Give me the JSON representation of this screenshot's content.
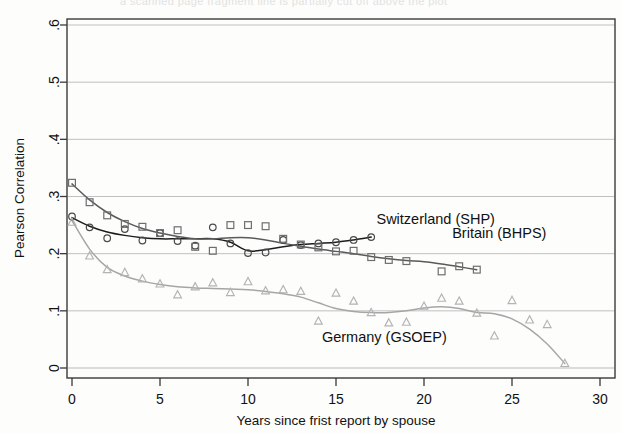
{
  "figure": {
    "top_edge_artifact": "a scanned page fragment line is partially cut off above the plot",
    "background_color": "#fdfdfc"
  },
  "chart_data": {
    "type": "scatter",
    "title": "",
    "subtitle": "",
    "xlabel": "Years since frist report by spouse",
    "ylabel": "Pearson Correlation",
    "xlim": [
      0,
      30
    ],
    "ylim": [
      0,
      0.6
    ],
    "xticks": [
      0,
      5,
      10,
      15,
      20,
      25,
      30
    ],
    "xticklabels": [
      "0",
      "5",
      "10",
      "15",
      "20",
      "25",
      "30"
    ],
    "yticks": [
      0,
      0.1,
      0.2,
      0.3,
      0.4,
      0.5,
      0.6
    ],
    "yticklabels": [
      "0",
      ".1",
      ".2",
      ".3",
      ".4",
      ".5",
      ".6"
    ],
    "grid": "horizontal gridlines only",
    "legend_position": "inline annotations next to each curve",
    "series": [
      {
        "name": "Switzerland (SHP)",
        "marker": "circle",
        "color": "#4a4a4a",
        "fit_color": "#1c1c1c",
        "label_x": 17.3,
        "label_y": 0.252,
        "points": [
          {
            "x": 0,
            "y": 0.265
          },
          {
            "x": 1,
            "y": 0.246
          },
          {
            "x": 2,
            "y": 0.227
          },
          {
            "x": 3,
            "y": 0.243
          },
          {
            "x": 4,
            "y": 0.223
          },
          {
            "x": 5,
            "y": 0.236
          },
          {
            "x": 6,
            "y": 0.222
          },
          {
            "x": 7,
            "y": 0.214
          },
          {
            "x": 8,
            "y": 0.246
          },
          {
            "x": 9,
            "y": 0.218
          },
          {
            "x": 10,
            "y": 0.201
          },
          {
            "x": 11,
            "y": 0.202
          },
          {
            "x": 12,
            "y": 0.224
          },
          {
            "x": 13,
            "y": 0.215
          },
          {
            "x": 14,
            "y": 0.218
          },
          {
            "x": 15,
            "y": 0.22
          },
          {
            "x": 16,
            "y": 0.224
          },
          {
            "x": 17,
            "y": 0.229
          }
        ],
        "fit": [
          {
            "x": 0,
            "y": 0.263
          },
          {
            "x": 1,
            "y": 0.248
          },
          {
            "x": 2,
            "y": 0.238
          },
          {
            "x": 3,
            "y": 0.232
          },
          {
            "x": 4,
            "y": 0.228
          },
          {
            "x": 5,
            "y": 0.226
          },
          {
            "x": 6,
            "y": 0.226
          },
          {
            "x": 7,
            "y": 0.226
          },
          {
            "x": 8,
            "y": 0.226
          },
          {
            "x": 9,
            "y": 0.22
          },
          {
            "x": 10,
            "y": 0.205
          },
          {
            "x": 11,
            "y": 0.207
          },
          {
            "x": 12,
            "y": 0.212
          },
          {
            "x": 13,
            "y": 0.216
          },
          {
            "x": 14,
            "y": 0.218
          },
          {
            "x": 15,
            "y": 0.22
          },
          {
            "x": 16,
            "y": 0.224
          },
          {
            "x": 17,
            "y": 0.229
          }
        ]
      },
      {
        "name": "Britain (BHPS)",
        "marker": "square",
        "color": "#6e6e6e",
        "fit_color": "#5a5a5a",
        "label_x": 21.6,
        "label_y": 0.228,
        "points": [
          {
            "x": 0,
            "y": 0.324
          },
          {
            "x": 1,
            "y": 0.29
          },
          {
            "x": 2,
            "y": 0.267
          },
          {
            "x": 3,
            "y": 0.252
          },
          {
            "x": 4,
            "y": 0.247
          },
          {
            "x": 5,
            "y": 0.236
          },
          {
            "x": 6,
            "y": 0.241
          },
          {
            "x": 7,
            "y": 0.212
          },
          {
            "x": 8,
            "y": 0.205
          },
          {
            "x": 9,
            "y": 0.25
          },
          {
            "x": 10,
            "y": 0.25
          },
          {
            "x": 11,
            "y": 0.248
          },
          {
            "x": 12,
            "y": 0.226
          },
          {
            "x": 13,
            "y": 0.216
          },
          {
            "x": 14,
            "y": 0.211
          },
          {
            "x": 15,
            "y": 0.204
          },
          {
            "x": 16,
            "y": 0.205
          },
          {
            "x": 17,
            "y": 0.194
          },
          {
            "x": 18,
            "y": 0.189
          },
          {
            "x": 19,
            "y": 0.187
          },
          {
            "x": 21,
            "y": 0.169
          },
          {
            "x": 22,
            "y": 0.178
          },
          {
            "x": 23,
            "y": 0.172
          }
        ],
        "fit": [
          {
            "x": 0,
            "y": 0.322
          },
          {
            "x": 1,
            "y": 0.294
          },
          {
            "x": 2,
            "y": 0.272
          },
          {
            "x": 3,
            "y": 0.256
          },
          {
            "x": 4,
            "y": 0.244
          },
          {
            "x": 5,
            "y": 0.236
          },
          {
            "x": 6,
            "y": 0.23
          },
          {
            "x": 7,
            "y": 0.226
          },
          {
            "x": 8,
            "y": 0.226
          },
          {
            "x": 9,
            "y": 0.228
          },
          {
            "x": 10,
            "y": 0.228
          },
          {
            "x": 11,
            "y": 0.224
          },
          {
            "x": 12,
            "y": 0.218
          },
          {
            "x": 13,
            "y": 0.213
          },
          {
            "x": 14,
            "y": 0.208
          },
          {
            "x": 15,
            "y": 0.204
          },
          {
            "x": 16,
            "y": 0.2
          },
          {
            "x": 17,
            "y": 0.195
          },
          {
            "x": 18,
            "y": 0.191
          },
          {
            "x": 19,
            "y": 0.188
          },
          {
            "x": 20,
            "y": 0.186
          },
          {
            "x": 21,
            "y": 0.182
          },
          {
            "x": 22,
            "y": 0.177
          },
          {
            "x": 23,
            "y": 0.172
          }
        ]
      },
      {
        "name": "Germany (GSOEP)",
        "marker": "triangle",
        "color": "#b3b3b3",
        "fit_color": "#a6a6a6",
        "label_x": 14.2,
        "label_y": 0.045,
        "points": [
          {
            "x": 0,
            "y": 0.255
          },
          {
            "x": 1,
            "y": 0.196
          },
          {
            "x": 2,
            "y": 0.172
          },
          {
            "x": 3,
            "y": 0.167
          },
          {
            "x": 4,
            "y": 0.156
          },
          {
            "x": 5,
            "y": 0.147
          },
          {
            "x": 6,
            "y": 0.128
          },
          {
            "x": 7,
            "y": 0.142
          },
          {
            "x": 8,
            "y": 0.149
          },
          {
            "x": 9,
            "y": 0.132
          },
          {
            "x": 10,
            "y": 0.151
          },
          {
            "x": 11,
            "y": 0.135
          },
          {
            "x": 12,
            "y": 0.137
          },
          {
            "x": 13,
            "y": 0.134
          },
          {
            "x": 14,
            "y": 0.082
          },
          {
            "x": 15,
            "y": 0.131
          },
          {
            "x": 16,
            "y": 0.117
          },
          {
            "x": 17,
            "y": 0.097
          },
          {
            "x": 18,
            "y": 0.079
          },
          {
            "x": 19,
            "y": 0.08
          },
          {
            "x": 20,
            "y": 0.108
          },
          {
            "x": 21,
            "y": 0.122
          },
          {
            "x": 22,
            "y": 0.117
          },
          {
            "x": 23,
            "y": 0.096
          },
          {
            "x": 24,
            "y": 0.056
          },
          {
            "x": 25,
            "y": 0.118
          },
          {
            "x": 26,
            "y": 0.084
          },
          {
            "x": 27,
            "y": 0.076
          },
          {
            "x": 28,
            "y": 0.008
          }
        ],
        "fit": [
          {
            "x": 0,
            "y": 0.258
          },
          {
            "x": 1,
            "y": 0.208
          },
          {
            "x": 2,
            "y": 0.176
          },
          {
            "x": 3,
            "y": 0.161
          },
          {
            "x": 4,
            "y": 0.152
          },
          {
            "x": 5,
            "y": 0.146
          },
          {
            "x": 6,
            "y": 0.142
          },
          {
            "x": 7,
            "y": 0.14
          },
          {
            "x": 8,
            "y": 0.139
          },
          {
            "x": 9,
            "y": 0.138
          },
          {
            "x": 10,
            "y": 0.137
          },
          {
            "x": 11,
            "y": 0.134
          },
          {
            "x": 12,
            "y": 0.13
          },
          {
            "x": 13,
            "y": 0.124
          },
          {
            "x": 14,
            "y": 0.114
          },
          {
            "x": 15,
            "y": 0.104
          },
          {
            "x": 16,
            "y": 0.099
          },
          {
            "x": 17,
            "y": 0.097
          },
          {
            "x": 18,
            "y": 0.097
          },
          {
            "x": 19,
            "y": 0.1
          },
          {
            "x": 20,
            "y": 0.105
          },
          {
            "x": 21,
            "y": 0.107
          },
          {
            "x": 22,
            "y": 0.104
          },
          {
            "x": 23,
            "y": 0.097
          },
          {
            "x": 24,
            "y": 0.095
          },
          {
            "x": 25,
            "y": 0.086
          },
          {
            "x": 26,
            "y": 0.068
          },
          {
            "x": 27,
            "y": 0.042
          },
          {
            "x": 28,
            "y": 0.008
          }
        ]
      }
    ]
  }
}
